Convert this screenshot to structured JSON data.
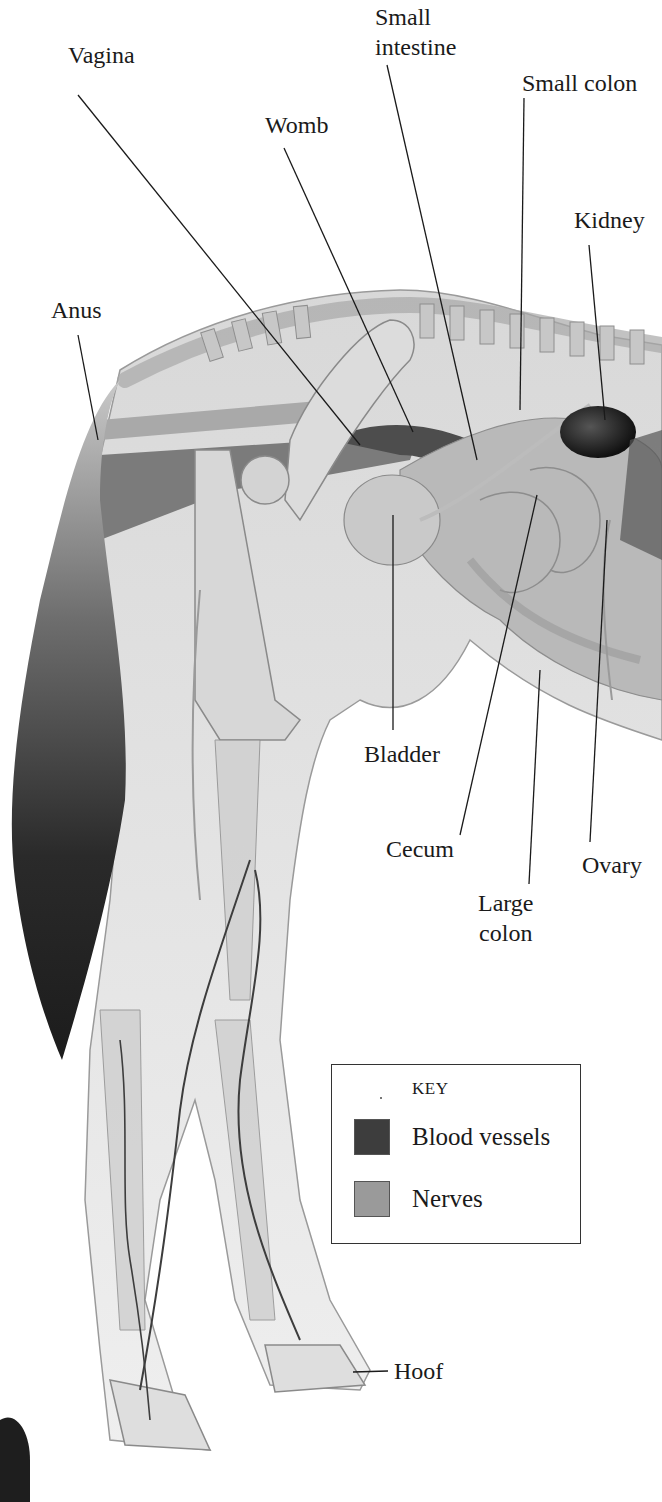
{
  "diagram": {
    "labels": [
      {
        "id": "small-intestine",
        "text": "Small\nintestine",
        "lines": [
          "Small",
          "intestine"
        ]
      },
      {
        "id": "vagina",
        "text": "Vagina"
      },
      {
        "id": "small-colon",
        "text": "Small colon"
      },
      {
        "id": "womb",
        "text": "Womb"
      },
      {
        "id": "kidney",
        "text": "Kidney"
      },
      {
        "id": "anus",
        "text": "Anus"
      },
      {
        "id": "bladder",
        "text": "Bladder"
      },
      {
        "id": "cecum",
        "text": "Cecum"
      },
      {
        "id": "ovary",
        "text": "Ovary"
      },
      {
        "id": "large-colon",
        "text": "Large\ncolon",
        "lines": [
          "Large",
          "colon"
        ]
      },
      {
        "id": "hoof",
        "text": "Hoof"
      }
    ],
    "key": {
      "title": "KEY",
      "items": [
        {
          "label": "Blood vessels",
          "color": "#3d3d3d"
        },
        {
          "label": "Nerves",
          "color": "#9a9a9a"
        }
      ]
    }
  },
  "colors": {
    "background": "#ffffff",
    "body_fill": "#e6e6e6",
    "organ_fill": "#bdbdbd",
    "bone_fill": "#d9d9d9",
    "tail_fill": "#2e2e2e",
    "vessel": "#3d3d3d",
    "nerve": "#9a9a9a",
    "leader_line": "#1a1a1a"
  }
}
